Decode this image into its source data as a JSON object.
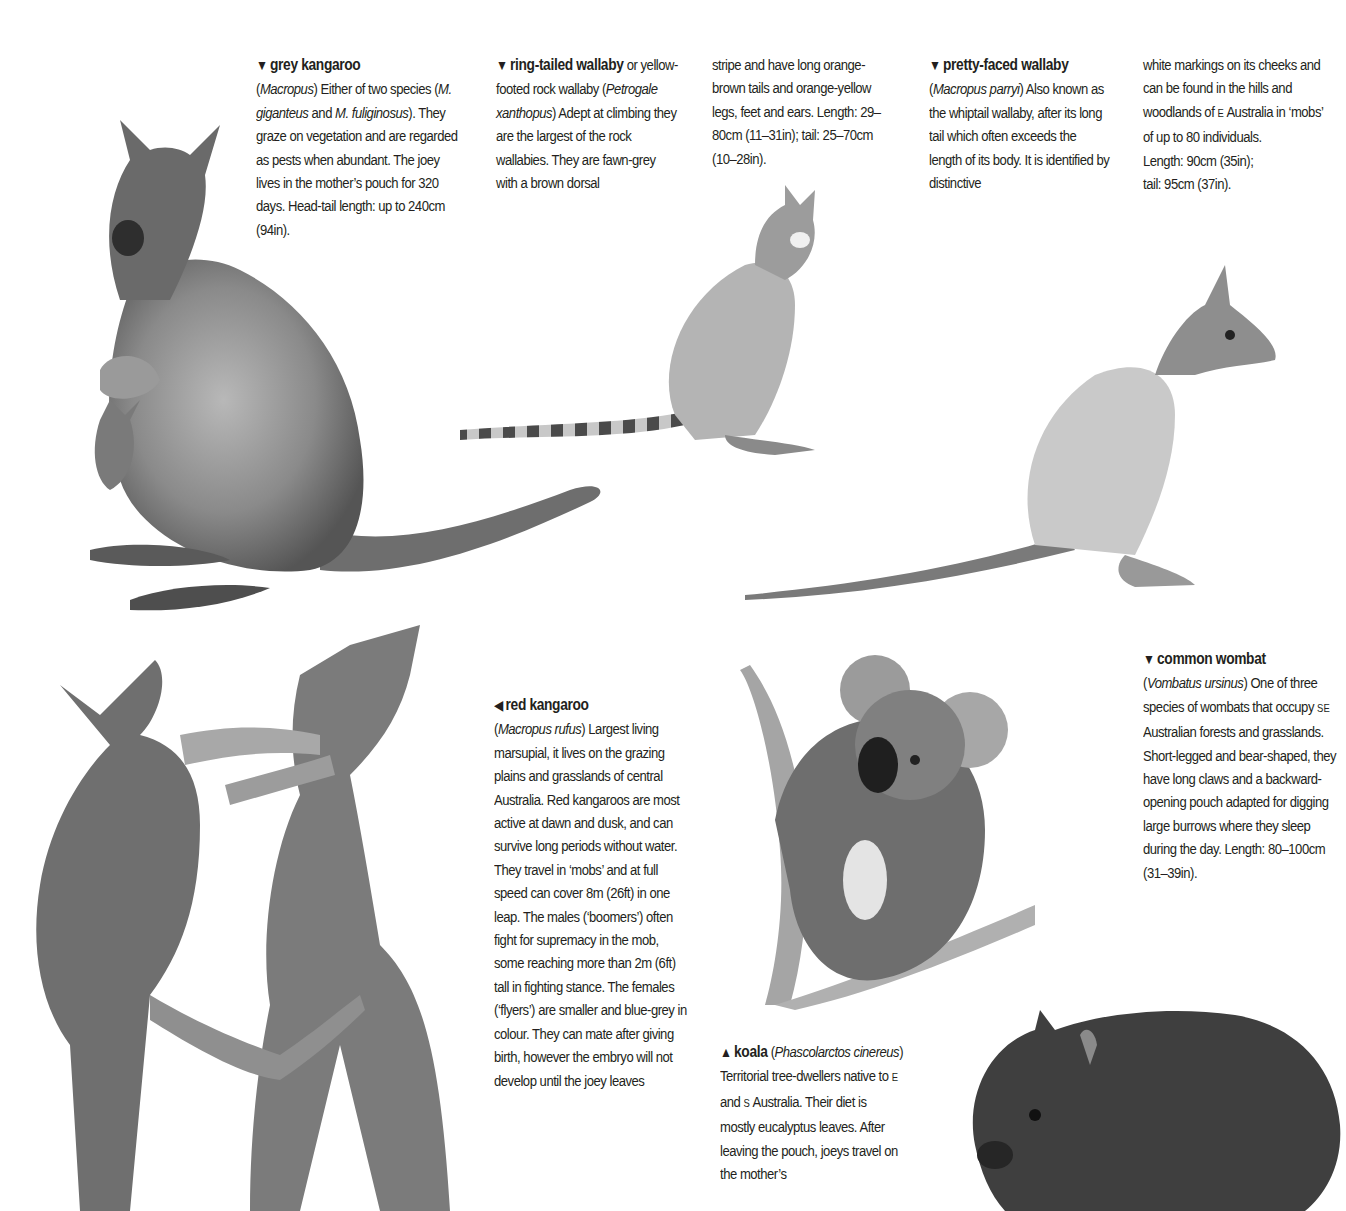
{
  "page": {
    "entries": {
      "grey_kangaroo": {
        "arrow": "▼",
        "title": "grey kangaroo",
        "open_paren": "(",
        "genus": "Macropus",
        "text1": ") Either of two species (",
        "latin1": "M. giganteus",
        "text2": " and ",
        "latin2": "M. fuliginosus",
        "text3": "). They graze on vegetation and are regarded as pests when abundant. The joey lives in the mother’s pouch for 320 days. Head-tail length: up to 240cm (94in)."
      },
      "ring_tailed_wallaby": {
        "arrow": "▼",
        "title": "ring-tailed wallaby",
        "text0": " or yellow-footed rock wallaby (",
        "latin": "Petrogale xanthopus",
        "text1": ") Adept at climbing they are the largest of the rock wallabies. They are fawn-grey with a brown dorsal",
        "continued": "stripe and have long orange-brown tails and orange-yellow legs, feet and ears. Length: 29–80cm (11–31in); tail: 25–70cm (10–28in)."
      },
      "pretty_faced_wallaby": {
        "arrow": "▼",
        "title": "pretty-faced wallaby",
        "open_paren": "(",
        "latin": "Macropus parryi",
        "text1": ") Also known as the whiptail wallaby, after its long tail which often exceeds the length of its body. It is identified by distinctive",
        "continued_a": "white markings on its cheeks and can be found in the hills and woodlands of ",
        "continued_sc": "E",
        "continued_b": " Australia in ‘mobs’ of up to 80 individuals.",
        "length": "Length: 90cm (35in);",
        "tail": "tail: 95cm (37in)."
      },
      "red_kangaroo": {
        "arrow": "◀",
        "title": "red kangaroo",
        "open_paren": "(",
        "latin": "Macropus rufus",
        "text1": ") Largest living marsupial, it lives on the grazing plains and grasslands of central Australia. Red kangaroos are most active at dawn and dusk, and can survive long periods without water. They travel in ‘mobs’ and at full speed can cover 8m (26ft) in one leap. The males (‘boomers’) often fight for supremacy in the mob, some reaching more than 2m (6ft) tall in fighting stance. The females (‘flyers’) are smaller and blue-grey in colour. They can mate after giving birth, however the embryo will not develop until the joey leaves"
      },
      "koala": {
        "arrow": "▲",
        "title": "koala",
        "open_paren": " (",
        "latin": "Phascolarctos cinereus",
        "text1": ") Territorial tree-dwellers native to ",
        "sc1": "E",
        "text2": " and ",
        "sc2": "S",
        "text3": " Australia. Their diet is mostly eucalyptus leaves. After leaving the pouch, joeys travel on the mother’s"
      },
      "common_wombat": {
        "arrow": "▼",
        "title": "common wombat",
        "open_paren": "(",
        "latin": "Vombatus ursinus",
        "text1": ") One of three species of wombats that occupy ",
        "sc": "SE",
        "text2": " Australian forests and grasslands. Short-legged and bear-shaped, they have long claws and a backward-opening pouch adapted for digging large burrows where they sleep during the day. Length: 80–100cm (31–39in)."
      }
    },
    "illustrations": [
      {
        "id": "grey-kangaroo",
        "caption": "grey kangaroo with joey in pouch"
      },
      {
        "id": "ring-tailed-wallaby",
        "caption": "ring-tailed wallaby"
      },
      {
        "id": "pretty-faced-wallaby",
        "caption": "pretty-faced wallaby"
      },
      {
        "id": "red-kangaroos",
        "caption": "two red kangaroos boxing"
      },
      {
        "id": "koala",
        "caption": "koala on branch"
      },
      {
        "id": "common-wombat",
        "caption": "common wombat"
      }
    ],
    "colors": {
      "text": "#231f20",
      "background": "#ffffff",
      "ink_dark": "#3a3a3a",
      "ink_mid": "#7d7d7d",
      "ink_light": "#c4c4c4"
    }
  }
}
